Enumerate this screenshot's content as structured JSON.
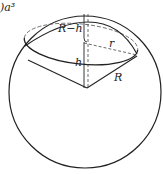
{
  "diagram": {
    "title_fragment": ")a³",
    "labels": {
      "r_minus_h": "R−h",
      "r": "r",
      "h": "h",
      "R": "R"
    },
    "elements": {
      "sphere": {
        "cx": 85,
        "cy": 92,
        "radius": 76
      },
      "cross_section_ellipse": {
        "cx": 81,
        "cy": 44,
        "rx": 57,
        "ry": 20,
        "rotate": 6
      },
      "cone_apex": {
        "x": 87,
        "y": 88
      },
      "axis_dashed_x": 88
    },
    "colors": {
      "stroke": "#222222",
      "background": "#ffffff"
    }
  }
}
